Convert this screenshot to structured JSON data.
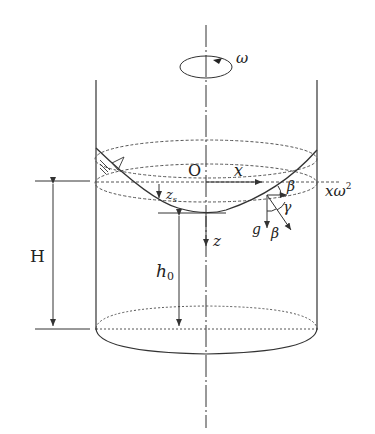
{
  "diagram": {
    "type": "rotating-cylinder-fluid-paraboloid",
    "labels": {
      "omega": "ω",
      "origin": "O",
      "x_axis": "x",
      "z_axis": "z",
      "zs": "z",
      "zs_sub": "s",
      "H": "H",
      "h0": "h",
      "h0_sub": "0",
      "beta_top": "β",
      "beta_bottom": "β",
      "gamma": "γ",
      "g": "g",
      "centrifugal": "xω",
      "centrifugal_sup": "2"
    },
    "colors": {
      "line": "#333333",
      "dashed": "#555555",
      "background": "#ffffff"
    }
  }
}
